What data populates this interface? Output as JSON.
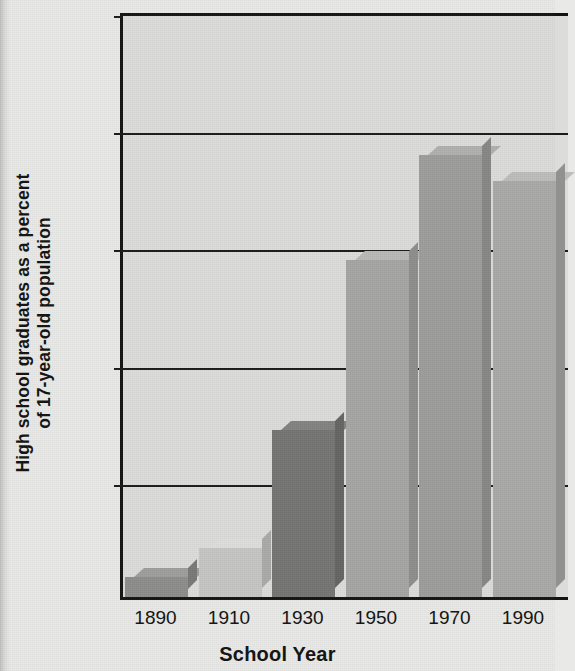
{
  "chart_data": {
    "type": "bar",
    "title": "",
    "xlabel": "School Year",
    "ylabel": "High school graduates as a percent of 17-year-old population",
    "ylabel_line1": "High school graduates as a percent",
    "ylabel_line2": "of 17-year-old population",
    "categories": [
      "1890",
      "1910",
      "1930",
      "1950",
      "1970",
      "1990"
    ],
    "values": [
      3.5,
      8.3,
      28.5,
      57.5,
      75.5,
      71
    ],
    "ylim": [
      0,
      100
    ],
    "ytick_labels": [
      "0",
      "20",
      "40",
      "60",
      "80",
      "100"
    ],
    "ytick_values": [
      0,
      20,
      40,
      60,
      80,
      100
    ],
    "grid": true,
    "grid_axis": "y",
    "legend": "none",
    "bar_style": "3d-extruded",
    "bar_colors": [
      "#8d8d8b",
      "#c6c6c4",
      "#757573",
      "#a5a5a3",
      "#9d9d9b",
      "#a9a9a7"
    ],
    "plot_background": "#dcdcda",
    "page_background": "#e9e9e7",
    "axis_color": "#131313"
  }
}
